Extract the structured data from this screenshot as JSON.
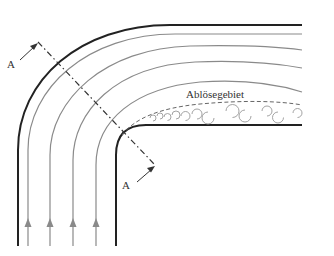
{
  "diagram": {
    "type": "flow-in-pipe-bend",
    "labels": {
      "separation_region": "Ablösegebiet",
      "section_start": "A",
      "section_end": "A"
    },
    "colors": {
      "wall": "#222222",
      "streamline": "#888888",
      "section_line": "#333333",
      "separation_boundary": "#666666",
      "vortex": "#999999"
    },
    "streamline_count": 4,
    "flow_direction": "upward-then-right"
  }
}
